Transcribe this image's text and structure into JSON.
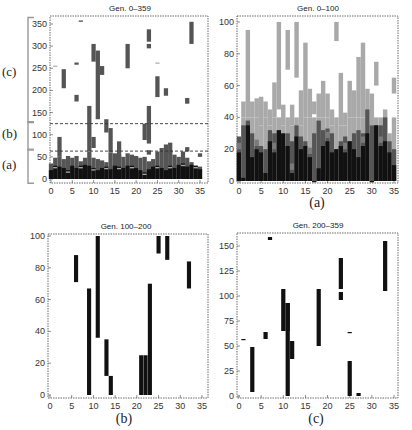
{
  "figure": {
    "captions": [
      "(a)",
      "(b)",
      "(c)"
    ],
    "bracket_labels": [
      "(c)",
      "(b)",
      "(a)"
    ],
    "colors": {
      "light": "#a9a9a9",
      "mid": "#7a7a7a",
      "dark": "#555555",
      "black": "#111111",
      "frame": "#444444"
    }
  },
  "chart_data": [
    {
      "type": "heatmap",
      "title": "Gen. 0–359",
      "xlabel": "",
      "ylabel": "",
      "xlim": [
        0,
        36
      ],
      "ylim": [
        -5,
        365
      ],
      "xticks": [
        0,
        5,
        10,
        15,
        20,
        25,
        30,
        35
      ],
      "yticks": [
        0,
        50,
        100,
        150,
        200,
        250,
        300,
        350
      ],
      "hlines_dashed": [
        63,
        125
      ],
      "bracket_annotations": [
        {
          "label": "(c)",
          "from": 125,
          "to": 365
        },
        {
          "label": "(b)",
          "from": 63,
          "to": 125
        },
        {
          "label": "(a)",
          "from": -5,
          "to": 63
        }
      ],
      "segments": [
        [
          2,
          50,
          95,
          "dark"
        ],
        [
          3,
          205,
          248,
          "dark"
        ],
        [
          6,
          175,
          190,
          "dark"
        ],
        [
          6,
          258,
          263,
          "dark"
        ],
        [
          7,
          355,
          358,
          "dark"
        ],
        [
          9,
          62,
          165,
          "dark"
        ],
        [
          10,
          265,
          305,
          "dark"
        ],
        [
          10,
          70,
          95,
          "dark"
        ],
        [
          11,
          135,
          290,
          "dark"
        ],
        [
          12,
          235,
          255,
          "dark"
        ],
        [
          13,
          105,
          135,
          "dark"
        ],
        [
          14,
          60,
          115,
          "dark"
        ],
        [
          16,
          45,
          85,
          "dark"
        ],
        [
          18,
          250,
          305,
          "dark"
        ],
        [
          22,
          88,
          125,
          "dark"
        ],
        [
          23,
          80,
          165,
          "dark"
        ],
        [
          23,
          295,
          305,
          "dark"
        ],
        [
          23,
          310,
          338,
          "dark"
        ],
        [
          23,
          55,
          65,
          "dark"
        ],
        [
          25,
          185,
          232,
          "dark"
        ],
        [
          27,
          188,
          205,
          "dark"
        ],
        [
          32,
          170,
          183,
          "dark"
        ],
        [
          33,
          305,
          355,
          "dark"
        ],
        [
          32,
          62,
          72,
          "dark"
        ],
        [
          28,
          58,
          82,
          "dark"
        ],
        [
          35,
          50,
          58,
          "dark"
        ],
        [
          1,
          255,
          256,
          "light"
        ],
        [
          25,
          262,
          263,
          "light"
        ]
      ],
      "base_heights": [
        35,
        48,
        50,
        45,
        52,
        48,
        52,
        40,
        48,
        62,
        48,
        45,
        42,
        38,
        60,
        58,
        55,
        50,
        58,
        55,
        52,
        48,
        50,
        40,
        45,
        62,
        70,
        78,
        65,
        55,
        50,
        62,
        48,
        38,
        30,
        28
      ],
      "base_black_heights": [
        20,
        30,
        28,
        25,
        20,
        30,
        25,
        30,
        32,
        30,
        25,
        20,
        25,
        28,
        22,
        30,
        28,
        25,
        30,
        30,
        25,
        20,
        15,
        22,
        28,
        30,
        25,
        20,
        30,
        25,
        32,
        35,
        28,
        32,
        30,
        22
      ]
    },
    {
      "type": "heatmap",
      "title": "Gen. 0–100",
      "xlim": [
        0,
        36
      ],
      "ylim": [
        -2,
        102
      ],
      "xticks": [
        0,
        5,
        10,
        15,
        20,
        25,
        30,
        35
      ],
      "yticks": [
        0,
        20,
        40,
        60,
        80,
        100
      ],
      "light_tops": [
        26,
        50,
        95,
        50,
        52,
        53,
        50,
        45,
        62,
        100,
        48,
        95,
        48,
        100,
        57,
        87,
        58,
        50,
        55,
        63,
        55,
        45,
        100,
        68,
        43,
        63,
        57,
        78,
        87,
        58,
        55,
        75,
        40,
        45,
        30,
        65
      ],
      "light_bottoms": [
        0,
        40,
        40,
        40,
        40,
        35,
        40,
        35,
        40,
        45,
        35,
        70,
        35,
        65,
        35,
        40,
        40,
        42,
        40,
        40,
        40,
        35,
        88,
        35,
        35,
        40,
        40,
        40,
        40,
        40,
        35,
        60,
        30,
        30,
        25,
        55
      ],
      "dark_tops": [
        28,
        35,
        38,
        30,
        22,
        22,
        20,
        32,
        30,
        30,
        22,
        30,
        25,
        35,
        28,
        25,
        20,
        30,
        38,
        32,
        33,
        30,
        20,
        25,
        28,
        25,
        30,
        32,
        30,
        45,
        35,
        35,
        35,
        40,
        25,
        20
      ],
      "black_tops": [
        18,
        2,
        35,
        15,
        20,
        18,
        5,
        25,
        18,
        32,
        30,
        22,
        5,
        28,
        20,
        22,
        15,
        0,
        8,
        22,
        25,
        18,
        20,
        22,
        18,
        25,
        20,
        15,
        22,
        30,
        0,
        35,
        22,
        25,
        18,
        10
      ]
    },
    {
      "type": "bar",
      "title": "Gen. 100–200",
      "xlim": [
        -0.5,
        36.5
      ],
      "ylim": [
        -1,
        101
      ],
      "xticks": [
        0,
        5,
        10,
        15,
        20,
        25,
        30,
        35
      ],
      "yticks": [
        0,
        20,
        40,
        60,
        80,
        100
      ],
      "segments": [
        [
          6,
          71,
          88
        ],
        [
          9,
          0,
          67
        ],
        [
          11,
          36,
          100
        ],
        [
          13,
          12,
          35
        ],
        [
          14,
          0,
          12
        ],
        [
          21,
          0,
          25
        ],
        [
          22,
          0,
          25
        ],
        [
          23,
          0,
          70
        ],
        [
          25,
          89,
          100
        ],
        [
          27,
          85,
          100
        ],
        [
          32,
          67,
          84
        ]
      ]
    },
    {
      "type": "bar",
      "title": "Gen. 200–359",
      "xlim": [
        -0.5,
        36.5
      ],
      "ylim": [
        -2,
        163
      ],
      "xticks": [
        0,
        5,
        10,
        15,
        20,
        25,
        30,
        35
      ],
      "yticks": [
        0,
        25,
        50,
        75,
        100,
        125,
        150
      ],
      "segments": [
        [
          1,
          56,
          57
        ],
        [
          3,
          4,
          49
        ],
        [
          6,
          57,
          64
        ],
        [
          7,
          156,
          159
        ],
        [
          10,
          65,
          107
        ],
        [
          11,
          0,
          93
        ],
        [
          11,
          65,
          93
        ],
        [
          12,
          37,
          55
        ],
        [
          18,
          50,
          107
        ],
        [
          23,
          96,
          104
        ],
        [
          23,
          107,
          138
        ],
        [
          25,
          63,
          64
        ],
        [
          25,
          0,
          35
        ],
        [
          27,
          0,
          3
        ],
        [
          33,
          105,
          155
        ]
      ]
    }
  ]
}
